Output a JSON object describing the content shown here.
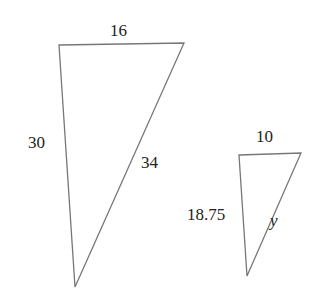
{
  "header": {
    "cutoff_text": "… … … … … …   g  …  … …  …  …   …"
  },
  "triangles": {
    "large": {
      "top": "16",
      "left": "30",
      "hyp": "34",
      "points": "59,45 184,43 75,287"
    },
    "small": {
      "top": "10",
      "left": "18.75",
      "hyp": "y",
      "points": "239,155 301,153 247,276"
    }
  },
  "colors": {
    "stroke": "#777777",
    "text": "#222222"
  }
}
